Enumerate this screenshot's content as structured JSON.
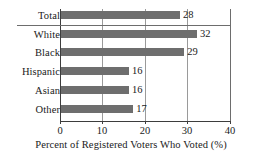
{
  "chart_data": {
    "type": "bar",
    "orientation": "horizontal",
    "title": "",
    "xlabel": "Percent of Registered Voters Who Voted (%)",
    "ylabel": "",
    "xlim": [
      0,
      40
    ],
    "xticks": [
      0,
      10,
      20,
      30,
      40
    ],
    "xtick_labels": [
      "0",
      "10",
      "20",
      "30",
      "40"
    ],
    "grid": "vertical gridlines at 10, 20, 30",
    "legend": "none",
    "bar_color": "#6e6e6e",
    "categories": [
      "Total",
      "White",
      "Black",
      "Hispanic",
      "Asian",
      "Other"
    ],
    "values": [
      28,
      32,
      29,
      16,
      16,
      17
    ],
    "value_labels": [
      "28",
      "32",
      "29",
      "16",
      "16",
      "17"
    ],
    "annotations": [
      "Horizontal separator rule drawn below the Total row, separating the overall total from the race/ethnicity breakdown"
    ]
  },
  "bars": [
    {
      "category": "Total",
      "value": 28,
      "label": "28"
    },
    {
      "category": "White",
      "value": 32,
      "label": "32"
    },
    {
      "category": "Black",
      "value": 29,
      "label": "29"
    },
    {
      "category": "Hispanic",
      "value": 16,
      "label": "16"
    },
    {
      "category": "Asian",
      "value": 16,
      "label": "16"
    },
    {
      "category": "Other",
      "value": 17,
      "label": "17"
    }
  ],
  "axis": {
    "x_title": "Percent of Registered Voters Who Voted (%)",
    "ticks": [
      "0",
      "10",
      "20",
      "30",
      "40"
    ]
  }
}
